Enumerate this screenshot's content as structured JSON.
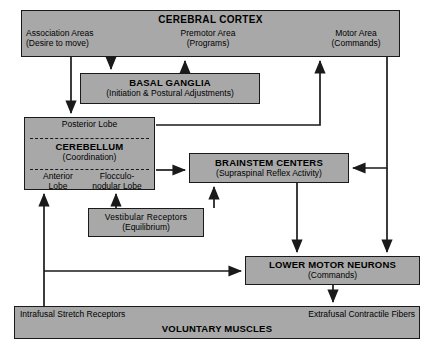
{
  "diagram": {
    "colors": {
      "box_fill": "#a8a8a8",
      "stroke": "#1a1a1a",
      "background": "#ffffff"
    }
  },
  "cortex": {
    "header": "CEREBRAL CORTEX",
    "association_line1": "Association Areas",
    "association_line2": "(Desire to move)",
    "premotor_line1": "Premotor Area",
    "premotor_line2": "(Programs)",
    "motor_line1": "Motor Area",
    "motor_line2": "(Commands)"
  },
  "basal_ganglia": {
    "title": "BASAL GANGLIA",
    "subtitle": "(Initiation & Postural Adjustments)"
  },
  "cerebellum": {
    "posterior_lobe": "Posterior Lobe",
    "title": "CEREBELLUM",
    "subtitle": "(Coordination)",
    "anterior_lobe": "Anterior\nLobe",
    "flocculonodular_lobe": "Flocculo-\nnodular Lobe"
  },
  "brainstem": {
    "title": "BRAINSTEM CENTERS",
    "subtitle": "(Supraspinal Reflex Activity)"
  },
  "vestibular": {
    "title": "Vestibular Receptors",
    "subtitle": "(Equilibrium)"
  },
  "lower_motor_neurons": {
    "title": "LOWER MOTOR NEURONS",
    "subtitle": "(Commands)"
  },
  "voluntary_muscles": {
    "intrafusal": "Intrafusal Stretch Receptors",
    "extrafusal": "Extrafusal Contractile Fibers",
    "title": "VOLUNTARY MUSCLES"
  },
  "connections": [
    {
      "name": "premotor-to-motor",
      "from": "Premotor Area",
      "to": "Motor Area"
    },
    {
      "name": "association-to-basal-ganglia",
      "from": "Association Areas",
      "to": "BASAL GANGLIA"
    },
    {
      "name": "association-to-cerebellum",
      "from": "Association Areas",
      "to": "CEREBELLUM"
    },
    {
      "name": "basal-ganglia-to-premotor",
      "from": "BASAL GANGLIA",
      "to": "Premotor Area"
    },
    {
      "name": "cerebellum-to-motor-area",
      "from": "Posterior Lobe",
      "to": "Motor Area"
    },
    {
      "name": "cerebellum-to-brainstem",
      "from": "Flocculonodular Lobe",
      "to": "BRAINSTEM CENTERS"
    },
    {
      "name": "vestibular-to-cerebellum",
      "from": "Vestibular Receptors",
      "to": "Flocculonodular Lobe"
    },
    {
      "name": "vestibular-to-brainstem",
      "from": "Vestibular Receptors",
      "to": "BRAINSTEM CENTERS"
    },
    {
      "name": "motor-area-to-brainstem",
      "from": "Motor Area",
      "to": "BRAINSTEM CENTERS"
    },
    {
      "name": "motor-area-to-lower-motor-neurons",
      "from": "Motor Area",
      "to": "LOWER MOTOR NEURONS"
    },
    {
      "name": "brainstem-to-lower-motor-neurons",
      "from": "BRAINSTEM CENTERS",
      "to": "LOWER MOTOR NEURONS"
    },
    {
      "name": "lower-motor-neurons-to-muscles",
      "from": "LOWER MOTOR NEURONS",
      "to": "Extrafusal Contractile Fibers"
    },
    {
      "name": "stretch-receptors-to-cerebellum",
      "from": "Intrafusal Stretch Receptors",
      "to": "Anterior Lobe"
    },
    {
      "name": "stretch-receptors-to-lower-motor-neurons",
      "from": "Intrafusal Stretch Receptors",
      "to": "LOWER MOTOR NEURONS"
    }
  ]
}
